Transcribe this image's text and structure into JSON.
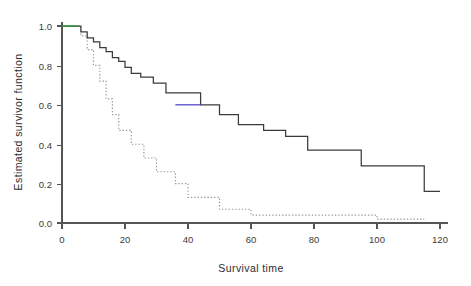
{
  "chart_data": {
    "type": "line",
    "title": "",
    "xlabel": "Survival time",
    "ylabel": "Estimated survivor function",
    "xlim": [
      0,
      120
    ],
    "ylim": [
      0.0,
      1.0
    ],
    "xticks": [
      0,
      20,
      40,
      60,
      80,
      100,
      120
    ],
    "xticklabels": [
      "0",
      "20",
      "40",
      "60",
      "80",
      "100",
      "120"
    ],
    "yticks": [
      0.0,
      0.2,
      0.4,
      0.6,
      0.8,
      1.0
    ],
    "yticklabels": [
      "0.0",
      "0.2",
      "0.4",
      "0.6",
      "0.8",
      "1.0"
    ],
    "grid": false,
    "legend": "none",
    "series": [
      {
        "name": "solid-survivor-curve",
        "style": "solid step",
        "color": "#3b3b3b",
        "x": [
          0,
          5,
          6,
          7,
          8,
          9,
          10,
          11,
          12,
          13,
          14,
          15,
          16,
          17,
          18,
          19,
          20,
          21,
          22,
          23,
          25,
          27,
          29,
          31,
          33,
          36,
          44,
          47,
          50,
          53,
          56,
          60,
          64,
          68,
          71,
          74,
          78,
          84,
          95,
          113,
          115,
          120
        ],
        "y": [
          1.0,
          1.0,
          0.97,
          0.97,
          0.94,
          0.94,
          0.92,
          0.92,
          0.89,
          0.89,
          0.87,
          0.87,
          0.84,
          0.84,
          0.82,
          0.82,
          0.79,
          0.79,
          0.76,
          0.76,
          0.74,
          0.74,
          0.71,
          0.71,
          0.66,
          0.66,
          0.6,
          0.6,
          0.55,
          0.55,
          0.5,
          0.5,
          0.47,
          0.47,
          0.44,
          0.44,
          0.37,
          0.37,
          0.29,
          0.29,
          0.16,
          0.16
        ]
      },
      {
        "name": "dotted-survivor-curve",
        "style": "dotted step",
        "color": "#9a9a9a",
        "x": [
          0,
          5,
          6,
          7,
          8,
          9,
          10,
          11,
          12,
          13,
          14,
          15,
          16,
          17,
          18,
          20,
          22,
          24,
          26,
          28,
          30,
          33,
          36,
          38,
          40,
          45,
          50,
          53,
          60,
          80,
          100,
          115
        ],
        "y": [
          1.0,
          1.0,
          0.95,
          0.95,
          0.88,
          0.88,
          0.8,
          0.8,
          0.72,
          0.72,
          0.63,
          0.63,
          0.55,
          0.55,
          0.47,
          0.47,
          0.4,
          0.4,
          0.33,
          0.33,
          0.26,
          0.26,
          0.2,
          0.2,
          0.13,
          0.13,
          0.07,
          0.07,
          0.04,
          0.04,
          0.02,
          0.02
        ]
      }
    ],
    "accents": [
      {
        "name": "green-start-segment",
        "color": "#2e9b3e",
        "from": [
          0,
          1.0
        ],
        "to": [
          5,
          1.0
        ]
      },
      {
        "name": "blue-plateau-segment",
        "color": "#5a50c8",
        "from": [
          36,
          0.6
        ],
        "to": [
          44,
          0.6
        ]
      }
    ]
  },
  "axes": {
    "x_title": "Survival time",
    "y_title": "Estimated survivor function"
  }
}
